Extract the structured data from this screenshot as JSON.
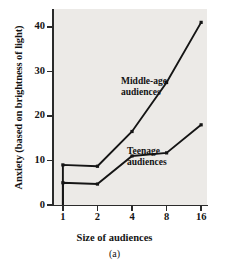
{
  "figure": {
    "caption": "(a)",
    "background": "#eceae7",
    "line_color": "#151515"
  },
  "chart_data": {
    "type": "line",
    "title": "",
    "xlabel": "Size of audiences",
    "ylabel": "Anxiety (based on brightness of light)",
    "x": [
      1,
      1,
      2,
      4,
      8,
      16
    ],
    "x_tick_labels": [
      "1",
      "2",
      "4",
      "8",
      "16"
    ],
    "x_tick_values": [
      1,
      2,
      4,
      8,
      16
    ],
    "x_scale": "log2",
    "xlim": [
      0.82,
      18
    ],
    "y_tick_labels": [
      "0",
      "10",
      "20",
      "30",
      "40"
    ],
    "y_tick_values": [
      0,
      10,
      20,
      30,
      40
    ],
    "ylim": [
      0,
      44
    ],
    "grid": false,
    "legend": "inline-annotations",
    "series": [
      {
        "name": "Middle-age audiences",
        "label": "Middle-age\naudiences",
        "label_line1": "Middle-age",
        "label_line2": "audiences",
        "values": [
          0,
          9.0,
          8.7,
          16.5,
          27.5,
          41.0
        ],
        "marker": "square"
      },
      {
        "name": "Teenage audiences",
        "label": "Teenage\naudiences",
        "label_line1": "Teenage",
        "label_line2": "audiences",
        "values": [
          0,
          5.0,
          4.7,
          11.0,
          11.7,
          18.0
        ],
        "marker": "square"
      }
    ]
  }
}
